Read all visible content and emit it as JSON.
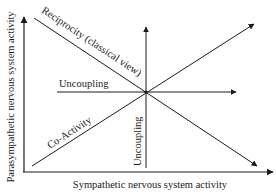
{
  "diagram": {
    "type": "conceptual-axes-diagram",
    "axes": {
      "x_label": "Sympathetic nervous system activity",
      "y_label": "Parasympathetic nervous system activity"
    },
    "lines": [
      {
        "id": "reciprocity",
        "label": "Reciprocity (classical view)",
        "direction": "top-left to bottom-right"
      },
      {
        "id": "coactivity",
        "label": "Co-Activity",
        "direction": "bottom-left to top-right"
      },
      {
        "id": "uncoupling-horizontal",
        "label": "Uncoupling",
        "direction": "horizontal"
      },
      {
        "id": "uncoupling-vertical",
        "label": "Uncoupling",
        "direction": "vertical"
      }
    ],
    "colors": {
      "line": "#1a1a1a",
      "background": "#ffffff"
    }
  }
}
